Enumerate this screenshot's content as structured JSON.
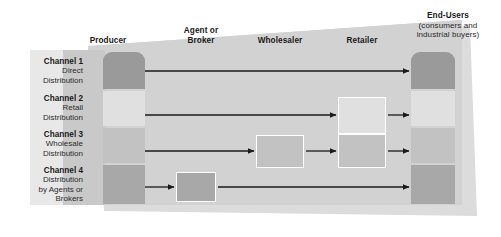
{
  "diagram": {
    "type": "flow-diagram",
    "palette": {
      "background_trapezoid": "#d2d2d2",
      "shadow": "#dcdcdc",
      "left_panel": "#c6c6c6",
      "tone_dark": "#9a9a9a",
      "tone_light": "#e0e0e0",
      "tone_mid": "#c2c2c2",
      "tone_mid_dark": "#a8a8a8",
      "arrow": "#1a1a1a",
      "box_border": "#ffffff",
      "text": "#1a1a1a"
    }
  },
  "columns": [
    {
      "key": "producer",
      "label": "Producer",
      "sublabel": ""
    },
    {
      "key": "agent",
      "label": "Agent or",
      "sublabel": "Broker"
    },
    {
      "key": "wholesaler",
      "label": "Wholesaler",
      "sublabel": ""
    },
    {
      "key": "retailer",
      "label": "Retailer",
      "sublabel": ""
    },
    {
      "key": "endusers",
      "label": "End-Users",
      "sublabel": "(consumers and",
      "sublabel2": "industrial buyers)"
    }
  ],
  "channels": [
    {
      "id": 1,
      "title": "Channel 1",
      "desc_line1": "Direct",
      "desc_line2": "Distribution",
      "desc_line3": "",
      "nodes": [
        "producer",
        "endusers"
      ],
      "tone": "dark"
    },
    {
      "id": 2,
      "title": "Channel 2",
      "desc_line1": "Retail",
      "desc_line2": "Distribution",
      "desc_line3": "",
      "nodes": [
        "producer",
        "retailer",
        "endusers"
      ],
      "tone": "light"
    },
    {
      "id": 3,
      "title": "Channel 3",
      "desc_line1": "Wholesale",
      "desc_line2": "Distribution",
      "desc_line3": "",
      "nodes": [
        "producer",
        "wholesaler",
        "retailer",
        "endusers"
      ],
      "tone": "mid"
    },
    {
      "id": 4,
      "title": "Channel 4",
      "desc_line1": "Distribution",
      "desc_line2": "by Agents or",
      "desc_line3": "Brokers",
      "nodes": [
        "producer",
        "agent",
        "endusers"
      ],
      "tone": "mid-dark"
    }
  ]
}
